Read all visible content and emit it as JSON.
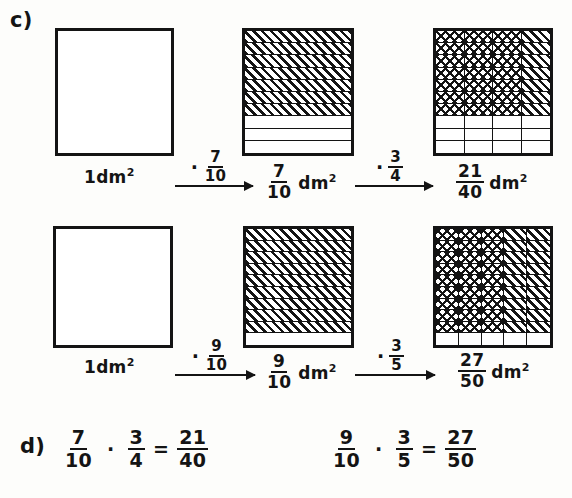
{
  "page": {
    "background_color": "#fdfdfb",
    "ink_color": "#141414"
  },
  "parts": {
    "c_label": "c)",
    "d_label": "d)"
  },
  "exercise_c": {
    "rows": [
      {
        "id": "row-1",
        "start_label": "1dm²",
        "start_square": {
          "cols": 1,
          "rows": 1,
          "shaded_cols": 0,
          "shaded_rows": 0,
          "hatch": "none"
        },
        "arrow1_op": "·",
        "arrow1_num": "7",
        "arrow1_den": "10",
        "middle_square": {
          "cols": 1,
          "rows": 10,
          "shaded_rows": 7,
          "hatch": "single"
        },
        "middle_label_num": "7",
        "middle_label_den": "10",
        "middle_label_unit": "dm²",
        "arrow2_op": "·",
        "arrow2_num": "3",
        "arrow2_den": "4",
        "end_square": {
          "cols": 4,
          "rows": 10,
          "shaded_cols": 3,
          "shaded_rows": 7,
          "hatch": "cross"
        },
        "end_label_num": "21",
        "end_label_den": "40",
        "end_label_unit": "dm²"
      },
      {
        "id": "row-2",
        "start_label": "1dm²",
        "start_square": {
          "cols": 1,
          "rows": 1,
          "shaded_cols": 0,
          "shaded_rows": 0,
          "hatch": "none"
        },
        "arrow1_op": "·",
        "arrow1_num": "9",
        "arrow1_den": "10",
        "middle_square": {
          "cols": 1,
          "rows": 10,
          "shaded_rows": 9,
          "hatch": "single"
        },
        "middle_label_num": "9",
        "middle_label_den": "10",
        "middle_label_unit": "dm²",
        "arrow2_op": "·",
        "arrow2_num": "3",
        "arrow2_den": "5",
        "end_square": {
          "cols": 5,
          "rows": 10,
          "shaded_cols": 3,
          "shaded_rows": 9,
          "hatch": "cross"
        },
        "end_label_num": "27",
        "end_label_den": "50",
        "end_label_unit": "dm²"
      }
    ]
  },
  "exercise_d": {
    "equations": [
      {
        "id": "equation-1",
        "left_num": "7",
        "left_den": "10",
        "op": "·",
        "right_num": "3",
        "right_den": "4",
        "equals": "=",
        "result_num": "21",
        "result_den": "40"
      },
      {
        "id": "equation-2",
        "left_num": "9",
        "left_den": "10",
        "op": "·",
        "right_num": "3",
        "right_den": "5",
        "equals": "=",
        "result_num": "27",
        "result_den": "50"
      }
    ]
  }
}
